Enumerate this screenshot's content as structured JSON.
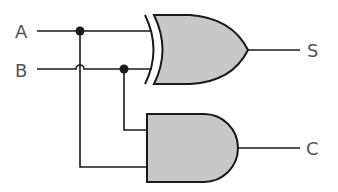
{
  "diagram": {
    "type": "logic-circuit",
    "name": "half-adder",
    "inputs": [
      {
        "label": "A"
      },
      {
        "label": "B"
      }
    ],
    "outputs": [
      {
        "label": "S",
        "from_gate": "XOR"
      },
      {
        "label": "C",
        "from_gate": "AND"
      }
    ],
    "gates": [
      {
        "type": "XOR",
        "inputs": [
          "A",
          "B"
        ],
        "output": "S"
      },
      {
        "type": "AND",
        "inputs": [
          "B",
          "A"
        ],
        "output": "C"
      }
    ],
    "colors": {
      "gate_fill": "#c8c8c8",
      "stroke": "#1a1a1a",
      "label": "#555555"
    }
  }
}
